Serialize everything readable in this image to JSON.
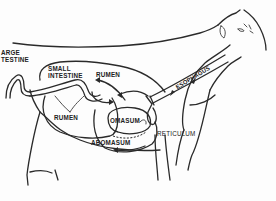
{
  "diagram": {
    "labels": {
      "large_intestine": [
        "ARGE",
        "TESTINE"
      ],
      "small_intestine": [
        "SMALL",
        "INTESTINE"
      ],
      "rumen_upper": "RUMEN",
      "rumen_lower": "RUMEN",
      "esophagus": "ESOPHAGUS",
      "omasum": "OMASUM",
      "reticulum": "RETICULUM",
      "abomasum": "ABOMASUM"
    },
    "colors": {
      "line": "#2a2a2a",
      "background": "#fdfdfd"
    }
  }
}
